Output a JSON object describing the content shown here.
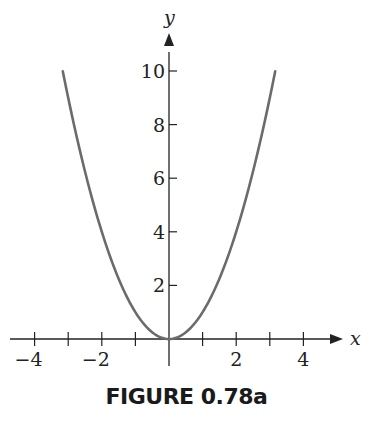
{
  "chart_data": {
    "type": "line",
    "title": "",
    "caption": "FIGURE 0.78a",
    "xlabel": "x",
    "ylabel": "y",
    "function": "y = x^2",
    "xlim": [
      -4.5,
      5
    ],
    "ylim": [
      0,
      11
    ],
    "x_ticks": [
      -4,
      -3,
      -2,
      -1,
      1,
      2,
      3,
      4
    ],
    "x_tick_labels": [
      "-4",
      "-2",
      "2",
      "4"
    ],
    "x_tick_label_values": [
      -4,
      -2,
      2,
      4
    ],
    "y_ticks": [
      2,
      4,
      6,
      8,
      10
    ],
    "y_tick_labels": [
      "2",
      "4",
      "6",
      "8",
      "10"
    ],
    "grid": false,
    "series": [
      {
        "name": "y = x^2",
        "color": "#6b6b6b",
        "x": [
          -3.16,
          -3,
          -2.5,
          -2,
          -1.5,
          -1,
          -0.5,
          0,
          0.5,
          1,
          1.5,
          2,
          2.5,
          3,
          3.16
        ],
        "y": [
          10,
          9,
          6.25,
          4,
          2.25,
          1,
          0.25,
          0,
          0.25,
          1,
          2.25,
          4,
          6.25,
          9,
          10
        ]
      }
    ]
  },
  "figure": {
    "caption": "FIGURE 0.78a",
    "x_axis_label": "x",
    "y_axis_label": "y",
    "curve_color": "#6b6b6b",
    "axis_color": "#222222"
  }
}
